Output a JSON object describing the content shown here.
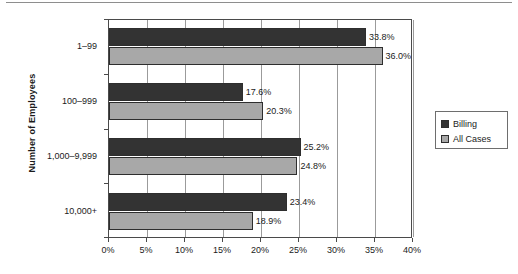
{
  "chart_data": {
    "type": "bar",
    "orientation": "horizontal",
    "title": "",
    "xlabel": "",
    "ylabel": "Number of Employees",
    "categories": [
      "1–99",
      "100–999",
      "1,000–9,999",
      "10,000+"
    ],
    "series": [
      {
        "name": "Billing",
        "color": "#333333",
        "values": [
          33.8,
          17.6,
          25.2,
          23.4
        ],
        "labels": [
          "33.8%",
          "17.6%",
          "25.2%",
          "23.4%"
        ]
      },
      {
        "name": "All Cases",
        "color": "#a8a8a8",
        "values": [
          36.0,
          20.3,
          24.8,
          18.9
        ],
        "labels": [
          "36.0%",
          "20.3%",
          "24.8%",
          "18.9%"
        ]
      }
    ],
    "xlim": [
      0,
      40
    ],
    "xticks": [
      0,
      5,
      10,
      15,
      20,
      25,
      30,
      35,
      40
    ],
    "xtick_labels": [
      "0%",
      "5%",
      "10%",
      "15%",
      "20%",
      "25%",
      "30%",
      "35%",
      "40%"
    ],
    "grid": "vertical",
    "legend_position": "right",
    "legend_entries": [
      "Billing",
      "All Cases"
    ]
  },
  "axis": {
    "y_title": "Number of Employees"
  },
  "legend": {
    "items": [
      {
        "label": "Billing",
        "swatch": "legend-swatch-billing"
      },
      {
        "label": "All Cases",
        "swatch": "legend-swatch-all-cases"
      }
    ]
  }
}
